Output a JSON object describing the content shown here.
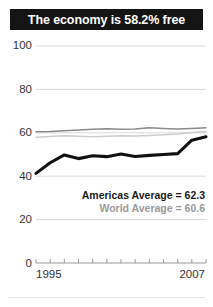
{
  "title": {
    "text": "The economy is 58.2% free"
  },
  "colors": {
    "banner_bg": "#141414",
    "banner_text": "#ffffff",
    "country_line": "#111111",
    "americas_line": "#8a8a8a",
    "world_line": "#cccccc",
    "gridline": "#d9d9d9",
    "axis": "#9a9a9a",
    "label_text": "#333333",
    "legend_americas": "#1a1a1a",
    "legend_world": "#9a9a9a"
  },
  "legend": {
    "americas_label": "Americas Average = 62.3",
    "world_label": "World Average = 60.6"
  },
  "chart_data": {
    "type": "line",
    "title": "The economy is 58.2% free",
    "xlabel": "",
    "ylabel": "",
    "xlim": [
      1995,
      2007
    ],
    "ylim": [
      0,
      100
    ],
    "grid": true,
    "legend_position": "inside-right",
    "yticks": [
      0,
      20,
      40,
      60,
      80,
      100
    ],
    "ytick_labels": [
      "0",
      "20",
      "40",
      "60",
      "80",
      "100"
    ],
    "x": [
      1995,
      1996,
      1997,
      1998,
      1999,
      2000,
      2001,
      2002,
      2003,
      2004,
      2005,
      2006,
      2007
    ],
    "xticks": [
      1995,
      1996,
      1997,
      1998,
      1999,
      2000,
      2001,
      2002,
      2003,
      2004,
      2005,
      2006,
      2007
    ],
    "xtick_labels_shown": [
      "1995",
      "2007"
    ],
    "series": [
      {
        "name": "Country",
        "style": "thick-black",
        "values": [
          41.3,
          46.2,
          49.8,
          48.1,
          49.4,
          49.0,
          50.2,
          49.1,
          49.6,
          50.0,
          50.4,
          56.6,
          58.2
        ]
      },
      {
        "name": "Americas Average",
        "style": "medium-gray",
        "values": [
          60.5,
          60.6,
          61.0,
          61.3,
          61.6,
          61.9,
          61.6,
          61.8,
          62.3,
          62.0,
          61.7,
          62.0,
          62.3
        ]
      },
      {
        "name": "World Average",
        "style": "light-gray",
        "values": [
          58.0,
          58.3,
          58.6,
          58.4,
          58.2,
          58.4,
          58.6,
          58.5,
          58.8,
          59.1,
          59.4,
          60.1,
          60.6
        ]
      }
    ],
    "annotations": [
      "Americas Average = 62.3",
      "World Average = 60.6"
    ]
  }
}
